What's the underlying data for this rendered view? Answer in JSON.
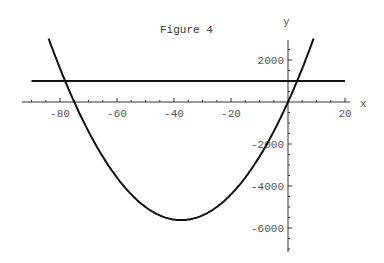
{
  "chart_data": {
    "type": "line",
    "title": "Figure 4",
    "xlabel": "x",
    "ylabel": "y",
    "xlim": [
      -90,
      20
    ],
    "ylim": [
      -7000,
      3000
    ],
    "x_ticks": [
      -80,
      -60,
      -40,
      -20,
      20
    ],
    "x_tick_labels": [
      "-80",
      "-60",
      "-40",
      "-20",
      "20"
    ],
    "y_ticks": [
      2000,
      -2000,
      -4000,
      -6000
    ],
    "y_tick_labels": [
      "2000",
      "-2000",
      "-4000",
      "-6000"
    ],
    "grid": false,
    "legend": null,
    "series": [
      {
        "name": "parabola y = 4x^2 + 300x",
        "x": [
          -84,
          -80,
          -75,
          -70,
          -60,
          -50,
          -37.5,
          -25,
          -10,
          0,
          5,
          9
        ],
        "y": [
          3024,
          1600,
          0,
          -1400,
          -3600,
          -5000,
          -5625,
          -5000,
          -2600,
          0,
          1600,
          3024
        ]
      },
      {
        "name": "horizontal line y = 1000",
        "x": [
          -90,
          20
        ],
        "y": [
          1000,
          1000
        ]
      }
    ],
    "intersections": [
      {
        "x": -78.2,
        "y": 1000
      },
      {
        "x": 3.2,
        "y": 1000
      }
    ]
  }
}
